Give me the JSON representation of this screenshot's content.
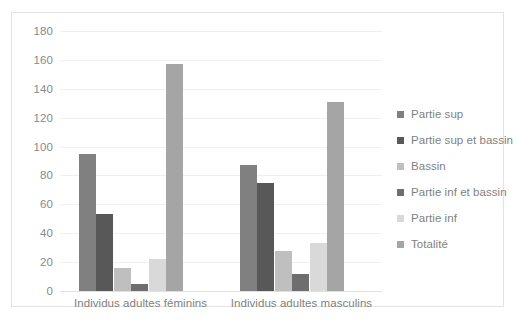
{
  "chart_data": {
    "type": "bar",
    "title": "",
    "subtitle": "",
    "xlabel": "",
    "ylabel": "",
    "categories": [
      "Individus adultes féminins",
      "Individus adultes masculins"
    ],
    "series": [
      {
        "name": "Partie sup",
        "color": "#808080",
        "values": [
          95,
          87
        ]
      },
      {
        "name": "Partie sup et bassin",
        "color": "#585858",
        "values": [
          53,
          75
        ]
      },
      {
        "name": "Bassin",
        "color": "#bfbfbf",
        "values": [
          16,
          28
        ]
      },
      {
        "name": "Partie inf et bassin",
        "color": "#6e6e6e",
        "values": [
          5,
          12
        ]
      },
      {
        "name": "Partie inf",
        "color": "#d9d9d9",
        "values": [
          22,
          33
        ]
      },
      {
        "name": "Totalité",
        "color": "#a5a5a5",
        "values": [
          157,
          131
        ]
      }
    ],
    "ylim": [
      0,
      180
    ],
    "yticks": [
      180,
      160,
      140,
      120,
      100,
      80,
      60,
      40,
      20,
      0
    ],
    "ytick_labels": [
      "180",
      "160",
      "140",
      "120",
      "100",
      "80",
      "60",
      "40",
      "20",
      "0"
    ],
    "grid": "horizontal",
    "legend_position": "right",
    "legend_marker": "square",
    "axis_label_color": "#7f7f7f",
    "gridline_color": "#efefef",
    "frame_color": "#e3e3e3",
    "background": "#ffffff"
  }
}
